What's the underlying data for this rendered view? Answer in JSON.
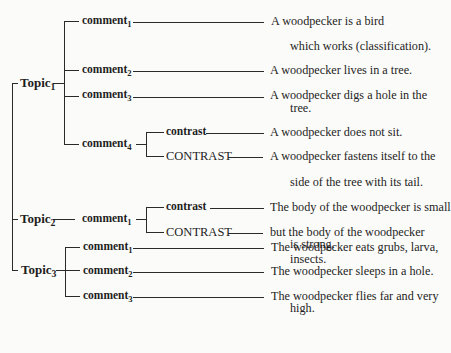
{
  "diagram": {
    "type": "topic-comment tree",
    "topics": [
      {
        "label": "Topic",
        "sub": "1",
        "comments": [
          {
            "label": "comment",
            "sub": "1",
            "text": [
              "A woodpecker is a bird",
              "which works (classification)."
            ]
          },
          {
            "label": "comment",
            "sub": "2",
            "text": [
              "A woodpecker lives in a tree."
            ]
          },
          {
            "label": "comment",
            "sub": "3",
            "text": [
              "A woodpecker digs a hole in the",
              "tree."
            ]
          },
          {
            "label": "comment",
            "sub": "4",
            "branches": [
              {
                "label": "contrast",
                "text": [
                  "A woodpecker does not sit."
                ]
              },
              {
                "label": "CONTRAST",
                "text": [
                  "A woodpecker fastens itself to the",
                  "side of the tree with its tail."
                ]
              }
            ]
          }
        ]
      },
      {
        "label": "Topic",
        "sub": "2",
        "comments": [
          {
            "label": "comment",
            "sub": "1",
            "branches": [
              {
                "label": "contrast",
                "text": [
                  "The body of the woodpecker is small"
                ]
              },
              {
                "label": "CONTRAST",
                "text": [
                  "but the body of the woodpecker",
                  "is strong."
                ]
              }
            ]
          }
        ]
      },
      {
        "label": "Topic",
        "sub": "3",
        "comments": [
          {
            "label": "comment",
            "sub": "1",
            "text": [
              "The woodpecker eats grubs, larva,",
              "insects."
            ]
          },
          {
            "label": "comment",
            "sub": "2",
            "text": [
              "The woodpecker sleeps in a hole."
            ]
          },
          {
            "label": "comment",
            "sub": "3",
            "text": [
              "The woodpecker flies far and very",
              "high."
            ]
          }
        ]
      }
    ]
  }
}
